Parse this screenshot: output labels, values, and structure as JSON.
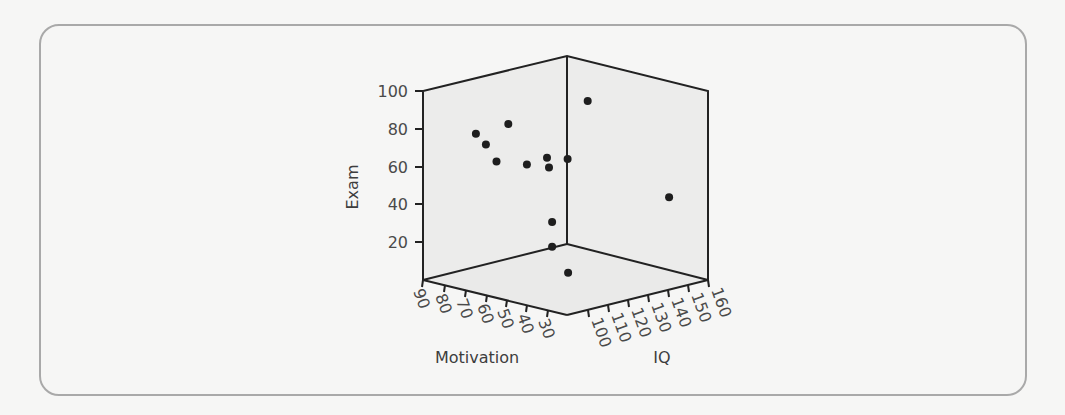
{
  "chart_data": {
    "type": "scatter",
    "subtype": "3d-scatter",
    "title": "",
    "axes": {
      "x": {
        "label": "Motivation",
        "ticks": [
          90,
          80,
          70,
          60,
          50,
          40,
          30
        ],
        "range": [
          20,
          90
        ]
      },
      "y": {
        "label": "IQ",
        "ticks": [
          100,
          110,
          120,
          130,
          140,
          150,
          160
        ],
        "range": [
          90,
          160
        ]
      },
      "z": {
        "label": "Exam",
        "ticks": [
          20,
          40,
          60,
          80,
          100
        ],
        "range": [
          0,
          100
        ]
      }
    },
    "grid": false,
    "legend": null,
    "points": [
      {
        "motivation": 74,
        "iq": 100,
        "exam": 79
      },
      {
        "motivation": 68,
        "iq": 110,
        "exam": 83
      },
      {
        "motivation": 74,
        "iq": 105,
        "exam": 72
      },
      {
        "motivation": 64,
        "iq": 100,
        "exam": 67
      },
      {
        "motivation": 59,
        "iq": 110,
        "exam": 64
      },
      {
        "motivation": 59,
        "iq": 120,
        "exam": 65
      },
      {
        "motivation": 58,
        "iq": 120,
        "exam": 60
      },
      {
        "motivation": 49,
        "iq": 120,
        "exam": 67
      },
      {
        "motivation": 49,
        "iq": 130,
        "exam": 95
      },
      {
        "motivation": 29,
        "iq": 150,
        "exam": 44
      },
      {
        "motivation": 37,
        "iq": 100,
        "exam": 42
      },
      {
        "motivation": 37,
        "iq": 100,
        "exam": 29
      },
      {
        "motivation": 39,
        "iq": 110,
        "exam": 12
      }
    ]
  },
  "labels": {
    "z_axis": "Exam",
    "x_axis": "Motivation",
    "y_axis": "IQ",
    "z_ticks": [
      "100",
      "80",
      "60",
      "40",
      "20"
    ],
    "x_ticks": [
      "90",
      "80",
      "70",
      "60",
      "50",
      "40",
      "30"
    ],
    "y_ticks": [
      "100",
      "110",
      "120",
      "130",
      "140",
      "150",
      "160"
    ]
  },
  "colors": {
    "face": "#ececeb",
    "line": "#222222",
    "point": "#1e1e1e",
    "frame": "#a9a9a9"
  }
}
